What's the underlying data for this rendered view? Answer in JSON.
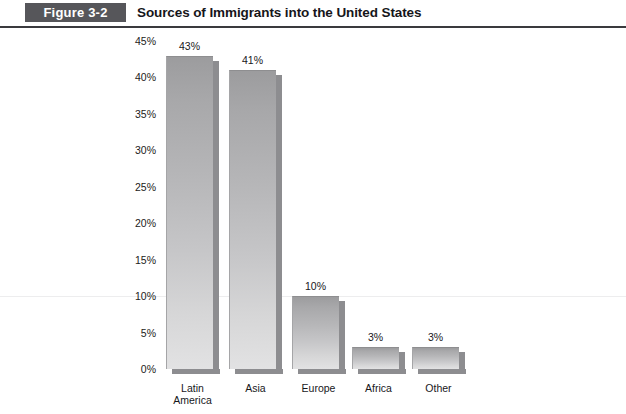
{
  "figure": {
    "badge": "Figure 3-2",
    "title": "Sources of Immigrants into the United States"
  },
  "chart_data": {
    "type": "bar",
    "title": "Sources of Immigrants into the United States",
    "xlabel": "",
    "ylabel": "",
    "categories": [
      "Latin America",
      "Asia",
      "Europe",
      "Africa",
      "Other"
    ],
    "values": [
      43,
      41,
      10,
      3,
      3
    ],
    "data_labels": [
      "43%",
      "41%",
      "10%",
      "3%",
      "3%"
    ],
    "ylim": [
      0,
      45
    ],
    "ytick_values": [
      0,
      5,
      10,
      15,
      20,
      25,
      30,
      35,
      40,
      45
    ],
    "ytick_labels": [
      "0%",
      "5%",
      "10%",
      "15%",
      "20%",
      "25%",
      "30%",
      "35%",
      "40%",
      "45%"
    ],
    "grid": false,
    "legend": false,
    "bar_color": "#bcbcbe",
    "bar_shadow_color": "#8d8d90"
  },
  "axis": {
    "ticks": [
      {
        "label": "45%",
        "value": 45
      },
      {
        "label": "40%",
        "value": 40
      },
      {
        "label": "35%",
        "value": 35
      },
      {
        "label": "30%",
        "value": 30
      },
      {
        "label": "25%",
        "value": 25
      },
      {
        "label": "20%",
        "value": 20
      },
      {
        "label": "15%",
        "value": 15
      },
      {
        "label": "10%",
        "value": 10
      },
      {
        "label": "5%",
        "value": 5
      },
      {
        "label": "0%",
        "value": 0
      }
    ]
  },
  "bars": [
    {
      "label": "Latin\nAmerica",
      "value_label": "43%",
      "value": 43
    },
    {
      "label": "Asia",
      "value_label": "41%",
      "value": 41
    },
    {
      "label": "Europe",
      "value_label": "10%",
      "value": 10
    },
    {
      "label": "Africa",
      "value_label": "3%",
      "value": 3
    },
    {
      "label": "Other",
      "value_label": "3%",
      "value": 3
    }
  ]
}
